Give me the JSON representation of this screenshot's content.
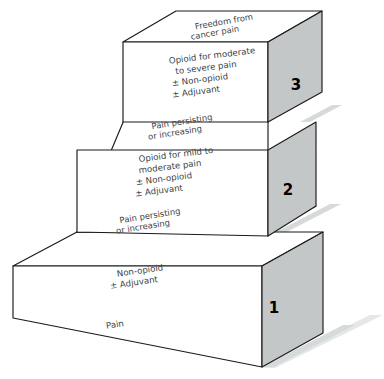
{
  "diagram": {
    "colors": {
      "side_face": "#c3c7c7",
      "front_face": "#ffffff",
      "top_face": "#ffffff",
      "outline": "#1a1a1a",
      "text": "#3a3f45",
      "number": "#000000",
      "shadow": "#d7dada"
    },
    "steps": [
      {
        "number": "1",
        "top_label_lines": [
          "Pain persisting",
          "or increasing"
        ],
        "front_label_lines": [
          "Non-opioid",
          "± Adjuvant"
        ]
      },
      {
        "number": "2",
        "top_label_lines": [
          "Pain persisting",
          "or increasing"
        ],
        "front_label_lines": [
          "Opioid for mild to",
          "moderate pain",
          "± Non-opioid",
          "± Adjuvant"
        ]
      },
      {
        "number": "3",
        "top_label_lines": [
          "Freedom from",
          "cancer pain"
        ],
        "front_label_lines": [
          "Opioid for moderate",
          "to severe pain",
          "± Non-opioid",
          "± Adjuvant"
        ]
      }
    ],
    "base_label": "Pain",
    "labels": {
      "step3_top_line1": "Freedom from",
      "step3_top_line2": "cancer pain",
      "step3_front_line1": "Opioid for moderate",
      "step3_front_line2": "to severe pain",
      "step3_front_line3": "± Non-opioid",
      "step3_front_line4": "± Adjuvant",
      "step3_number": "3",
      "step2_top_line1": "Pain persisting",
      "step2_top_line2": "or increasing",
      "step2_front_line1": "Opioid for mild to",
      "step2_front_line2": "moderate pain",
      "step2_front_line3": "± Non-opioid",
      "step2_front_line4": "± Adjuvant",
      "step2_number": "2",
      "step1_top_line1": "Pain persisting",
      "step1_top_line2": "or increasing",
      "step1_front_line1": "Non-opioid",
      "step1_front_line2": "± Adjuvant",
      "step1_number": "1",
      "base": "Pain"
    }
  }
}
